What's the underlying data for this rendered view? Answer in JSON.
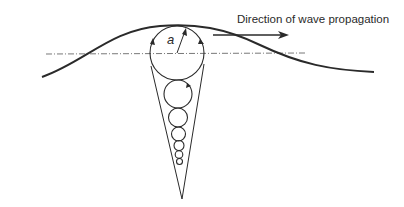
{
  "diagram": {
    "type": "wave-orbital-motion",
    "labels": {
      "direction": "Direction of wave propagation",
      "radius": "a"
    },
    "colors": {
      "stroke": "#2a2a2a",
      "background": "#ffffff"
    },
    "orbits": [
      {
        "cx": 177,
        "cy": 53,
        "r": 27
      },
      {
        "cx": 178,
        "cy": 94,
        "r": 14
      },
      {
        "cx": 178,
        "cy": 117,
        "r": 9.5
      },
      {
        "cx": 178,
        "cy": 133,
        "r": 7
      },
      {
        "cx": 178,
        "cy": 145,
        "r": 5
      },
      {
        "cx": 179,
        "cy": 154,
        "r": 3.8
      },
      {
        "cx": 179,
        "cy": 161,
        "r": 3
      }
    ]
  }
}
